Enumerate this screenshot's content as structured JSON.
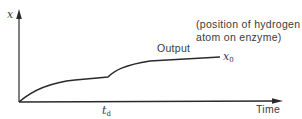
{
  "diagram": {
    "axes": {
      "y_label": "x",
      "x_label": "Time"
    },
    "curve": {
      "label": "Output",
      "end_label_base": "x",
      "end_label_sub": "0"
    },
    "tick": {
      "label_base": "t",
      "label_sub": "d"
    },
    "annotation": {
      "line1": "(position of hydrogen",
      "line2": "atom on enzyme)"
    },
    "colors": {
      "line": "#2a2a2a",
      "text": "#3a3a3a",
      "background": "#ffffff"
    }
  }
}
